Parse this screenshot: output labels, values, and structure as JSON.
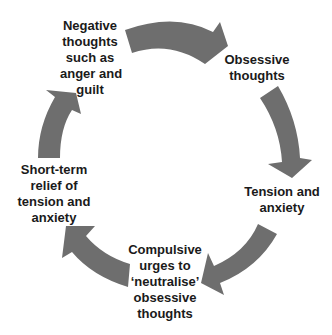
{
  "diagram": {
    "type": "cycle",
    "arrow_color": "#6e6e6e",
    "text_color": "#1a1a1a",
    "nodes": [
      {
        "id": "negative",
        "lines": [
          "Negative",
          "thoughts",
          "such as",
          "anger and",
          "guilt"
        ]
      },
      {
        "id": "obsessive",
        "lines": [
          "Obsessive",
          "thoughts"
        ]
      },
      {
        "id": "tension",
        "lines": [
          "Tension and",
          "anxiety"
        ]
      },
      {
        "id": "compulsive",
        "lines": [
          "Compulsive",
          "urges to",
          "‘neutralise’",
          "obsessive",
          "thoughts"
        ]
      },
      {
        "id": "relief",
        "lines": [
          "Short-term",
          "relief of",
          "tension and",
          "anxiety"
        ]
      }
    ],
    "edges": [
      {
        "from": "negative",
        "to": "obsessive"
      },
      {
        "from": "obsessive",
        "to": "tension"
      },
      {
        "from": "tension",
        "to": "compulsive"
      },
      {
        "from": "compulsive",
        "to": "relief"
      },
      {
        "from": "relief",
        "to": "negative"
      }
    ]
  }
}
